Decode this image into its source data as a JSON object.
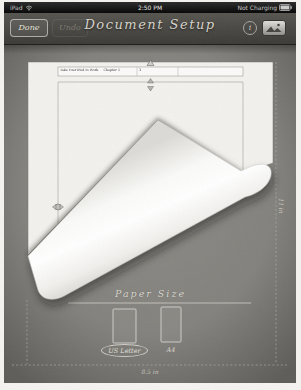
{
  "status_bar": {
    "carrier": "iPad",
    "time": "2:50 PM",
    "battery_status": "Not Charging"
  },
  "toolbar": {
    "done_label": "Done",
    "undo_label": "Undo",
    "title": "Document Setup",
    "info_glyph": "i"
  },
  "document_page": {
    "header_text": "Take Your iPad to Work     Chapter 1",
    "header_page_number": "1"
  },
  "dimensions": {
    "width_label": "8.5 in",
    "height_label": "11 in"
  },
  "paper_size": {
    "title": "Paper Size",
    "options": [
      {
        "label": "US Letter",
        "selected": true
      },
      {
        "label": "A4",
        "selected": false
      }
    ]
  },
  "colors": {
    "canvas_gray": "#8b8984",
    "chalk": "#d8d6ce",
    "status_black": "#0c0c0c",
    "page_white": "#f2f1ed"
  }
}
